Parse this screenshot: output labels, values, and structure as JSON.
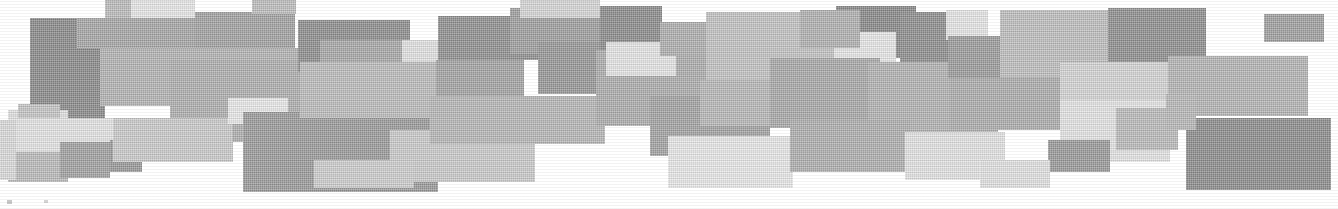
{
  "figure": {
    "width": 1338,
    "height": 209,
    "background_color": "#ffffff"
  },
  "palette": {
    "very_light": "#e8e8e8",
    "light": "#dcdcdc",
    "light_mid": "#cfcfcf",
    "mid": "#bdbdbd",
    "mid_dark": "#ababab",
    "dark": "#969696",
    "darker": "#878787",
    "darkest": "#7d7d7d"
  },
  "blocks": [
    {
      "name": "block-left-dark-tall",
      "x": 30,
      "y": 18,
      "w": 75,
      "h": 105,
      "color": "#8b8b8b"
    },
    {
      "name": "block-left-midtone",
      "x": 105,
      "y": 0,
      "w": 26,
      "h": 18,
      "color": "#bdbdbd"
    },
    {
      "name": "block-top-pale-a",
      "x": 131,
      "y": 0,
      "w": 64,
      "h": 40,
      "color": "#e9e9e9"
    },
    {
      "name": "block-top-mid-a",
      "x": 77,
      "y": 18,
      "w": 118,
      "h": 30,
      "color": "#a8a8a8"
    },
    {
      "name": "block-top-grey-b",
      "x": 195,
      "y": 12,
      "w": 100,
      "h": 48,
      "color": "#a3a3a3"
    },
    {
      "name": "block-upper-mid-wide",
      "x": 100,
      "y": 48,
      "w": 200,
      "h": 58,
      "color": "#b5b5b5"
    },
    {
      "name": "block-center-left-broad",
      "x": 170,
      "y": 60,
      "w": 150,
      "h": 82,
      "color": "#b0b0b0"
    },
    {
      "name": "block-left-pale-low",
      "x": 8,
      "y": 110,
      "w": 60,
      "h": 40,
      "color": "#e2e2e2"
    },
    {
      "name": "block-left-lowmid",
      "x": 18,
      "y": 104,
      "w": 42,
      "h": 24,
      "color": "#c6c6c6"
    },
    {
      "name": "block-left-pale-wide",
      "x": 8,
      "y": 118,
      "w": 105,
      "h": 42,
      "color": "#e6e6e6"
    },
    {
      "name": "block-left-bottom-grey",
      "x": 8,
      "y": 152,
      "w": 60,
      "h": 30,
      "color": "#bcbcbc"
    },
    {
      "name": "block-left-small-dark",
      "x": 60,
      "y": 142,
      "w": 50,
      "h": 36,
      "color": "#a2a2a2"
    },
    {
      "name": "block-lower-left-dark-box",
      "x": 110,
      "y": 140,
      "w": 32,
      "h": 32,
      "color": "#9a9a9a"
    },
    {
      "name": "block-mid-light-strip",
      "x": 113,
      "y": 118,
      "w": 120,
      "h": 44,
      "color": "#cccccc"
    },
    {
      "name": "block-pale-small-c",
      "x": 228,
      "y": 98,
      "w": 60,
      "h": 26,
      "color": "#ebebeb"
    },
    {
      "name": "block-center-dark-large",
      "x": 243,
      "y": 112,
      "w": 195,
      "h": 80,
      "color": "#9c9c9c"
    },
    {
      "name": "block-center-upper-dark",
      "x": 298,
      "y": 20,
      "w": 112,
      "h": 52,
      "color": "#8f8f8f"
    },
    {
      "name": "block-center-grey-mid",
      "x": 320,
      "y": 40,
      "w": 118,
      "h": 70,
      "color": "#a9a9a9"
    },
    {
      "name": "block-pale-center-a",
      "x": 402,
      "y": 40,
      "w": 62,
      "h": 30,
      "color": "#e4e4e4"
    },
    {
      "name": "block-center-band-wide",
      "x": 300,
      "y": 62,
      "w": 170,
      "h": 56,
      "color": "#bdbdbd"
    },
    {
      "name": "block-center-low-light",
      "x": 390,
      "y": 130,
      "w": 145,
      "h": 52,
      "color": "#cccccc"
    },
    {
      "name": "block-center-mid-grey",
      "x": 436,
      "y": 60,
      "w": 88,
      "h": 58,
      "color": "#a5a5a5"
    },
    {
      "name": "block-upper-dark-d",
      "x": 438,
      "y": 16,
      "w": 100,
      "h": 44,
      "color": "#919191"
    },
    {
      "name": "block-grey-long-e",
      "x": 430,
      "y": 96,
      "w": 175,
      "h": 48,
      "color": "#b8b8b8"
    },
    {
      "name": "block-upper-grey-f",
      "x": 510,
      "y": 8,
      "w": 90,
      "h": 46,
      "color": "#a0a0a0"
    },
    {
      "name": "block-mid-dark-g",
      "x": 538,
      "y": 42,
      "w": 90,
      "h": 52,
      "color": "#989898"
    },
    {
      "name": "block-pale-mid-h",
      "x": 520,
      "y": 0,
      "w": 80,
      "h": 18,
      "color": "#d8d8d8"
    },
    {
      "name": "block-center-right-broad",
      "x": 596,
      "y": 50,
      "w": 120,
      "h": 76,
      "color": "#aeaeae"
    },
    {
      "name": "block-upper-dark-right",
      "x": 600,
      "y": 6,
      "w": 62,
      "h": 44,
      "color": "#8d8d8d"
    },
    {
      "name": "block-pale-right-a",
      "x": 606,
      "y": 42,
      "w": 70,
      "h": 34,
      "color": "#e7e7e7"
    },
    {
      "name": "block-grey-right-b",
      "x": 660,
      "y": 22,
      "w": 58,
      "h": 34,
      "color": "#b0b0b0"
    },
    {
      "name": "block-light-center-i",
      "x": 706,
      "y": 12,
      "w": 128,
      "h": 92,
      "color": "#c4c4c4"
    },
    {
      "name": "block-mid-low-j",
      "x": 650,
      "y": 96,
      "w": 120,
      "h": 60,
      "color": "#a4a4a4"
    },
    {
      "name": "block-pale-low-k",
      "x": 668,
      "y": 136,
      "w": 125,
      "h": 52,
      "color": "#eaeaea"
    },
    {
      "name": "block-band-mid-l",
      "x": 700,
      "y": 80,
      "w": 170,
      "h": 46,
      "color": "#b9b9b9"
    },
    {
      "name": "block-upper-dark-m",
      "x": 836,
      "y": 6,
      "w": 80,
      "h": 52,
      "color": "#8a8a8a"
    },
    {
      "name": "block-pale-upper-n",
      "x": 834,
      "y": 32,
      "w": 62,
      "h": 32,
      "color": "#e9e9e9"
    },
    {
      "name": "block-grey-upper-o",
      "x": 800,
      "y": 10,
      "w": 60,
      "h": 38,
      "color": "#b2b2b2"
    },
    {
      "name": "block-mid-right-p",
      "x": 770,
      "y": 58,
      "w": 110,
      "h": 70,
      "color": "#aaaaaa"
    },
    {
      "name": "block-dark-right-q",
      "x": 900,
      "y": 12,
      "w": 85,
      "h": 60,
      "color": "#8f8f8f"
    },
    {
      "name": "block-pale-small-r",
      "x": 884,
      "y": 74,
      "w": 32,
      "h": 28,
      "color": "#ececec"
    },
    {
      "name": "block-grey-broad-s",
      "x": 868,
      "y": 62,
      "w": 130,
      "h": 74,
      "color": "#b4b4b4"
    },
    {
      "name": "block-low-grey-t",
      "x": 790,
      "y": 120,
      "w": 120,
      "h": 52,
      "color": "#b0b0b0"
    },
    {
      "name": "block-pale-low-u",
      "x": 905,
      "y": 132,
      "w": 100,
      "h": 48,
      "color": "#e5e5e5"
    },
    {
      "name": "block-pale-right-v",
      "x": 946,
      "y": 10,
      "w": 42,
      "h": 30,
      "color": "#e8e8e8"
    },
    {
      "name": "block-dark-right-w",
      "x": 948,
      "y": 36,
      "w": 60,
      "h": 42,
      "color": "#9d9d9d"
    },
    {
      "name": "block-grey-right-x",
      "x": 1000,
      "y": 10,
      "w": 130,
      "h": 75,
      "color": "#c0c0c0"
    },
    {
      "name": "block-dark-right-y",
      "x": 1108,
      "y": 8,
      "w": 98,
      "h": 56,
      "color": "#909090"
    },
    {
      "name": "block-far-right-dark",
      "x": 1264,
      "y": 14,
      "w": 60,
      "h": 28,
      "color": "#a1a1a1"
    },
    {
      "name": "block-mid-right-z",
      "x": 950,
      "y": 78,
      "w": 165,
      "h": 52,
      "color": "#aeaeae"
    },
    {
      "name": "block-light-right-aa",
      "x": 1060,
      "y": 62,
      "w": 110,
      "h": 50,
      "color": "#d6d6d6"
    },
    {
      "name": "block-grey-right-ab",
      "x": 1168,
      "y": 56,
      "w": 140,
      "h": 60,
      "color": "#b6b6b6"
    },
    {
      "name": "block-pale-right-ac",
      "x": 1060,
      "y": 100,
      "w": 110,
      "h": 62,
      "color": "#e6e6e6"
    },
    {
      "name": "block-dark-small-ad",
      "x": 1048,
      "y": 140,
      "w": 62,
      "h": 32,
      "color": "#9b9b9b"
    },
    {
      "name": "block-grey-right-ae",
      "x": 1116,
      "y": 108,
      "w": 62,
      "h": 42,
      "color": "#bcbcbc"
    },
    {
      "name": "block-dark-corner-af",
      "x": 1186,
      "y": 118,
      "w": 145,
      "h": 72,
      "color": "#8e8e8e"
    },
    {
      "name": "block-pale-bottom-ag",
      "x": 980,
      "y": 160,
      "w": 70,
      "h": 28,
      "color": "#e3e3e3"
    },
    {
      "name": "block-grey-bottom-ah",
      "x": 1166,
      "y": 94,
      "w": 30,
      "h": 36,
      "color": "#b9b9b9"
    },
    {
      "name": "block-light-bottom-ai",
      "x": 314,
      "y": 160,
      "w": 100,
      "h": 28,
      "color": "#cfcfcf"
    },
    {
      "name": "block-left-edge-aj",
      "x": 0,
      "y": 120,
      "w": 16,
      "h": 60,
      "color": "#dcdcdc"
    },
    {
      "name": "block-top-edge-ak",
      "x": 252,
      "y": 0,
      "w": 44,
      "h": 14,
      "color": "#bfbfbf"
    }
  ],
  "artifacts": [
    {
      "name": "residual-mark-left",
      "x": 7,
      "y": 200,
      "w": 5,
      "h": 4,
      "color": "#c8c8c8"
    },
    {
      "name": "residual-mark-center",
      "x": 44,
      "y": 200,
      "w": 4,
      "h": 3,
      "color": "#d4d4d4"
    }
  ]
}
